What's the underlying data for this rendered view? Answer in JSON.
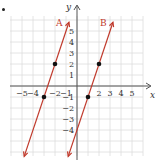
{
  "chart_data": {
    "type": "line",
    "title": "",
    "xlabel": "x",
    "ylabel": "y",
    "xlim": [
      -6,
      6
    ],
    "ylim": [
      -6,
      6
    ],
    "grid": true,
    "x_ticks": [
      -5,
      -4,
      -2,
      -1,
      2,
      3,
      4,
      5
    ],
    "y_ticks": [
      5,
      4,
      3,
      2,
      1,
      -1,
      -2,
      -3,
      -4
    ],
    "series": [
      {
        "name": "A",
        "slope": 3,
        "intercept": 8,
        "points": [
          [
            -2,
            2
          ],
          [
            -3,
            -1
          ]
        ],
        "color": "#c0392b"
      },
      {
        "name": "B",
        "slope": 3,
        "intercept": -4,
        "points": [
          [
            2,
            2
          ],
          [
            1,
            -1
          ]
        ],
        "color": "#c0392b"
      }
    ]
  },
  "labels": {
    "x_axis": "x",
    "y_axis": "y",
    "line_a": "A",
    "line_b": "B"
  },
  "colors": {
    "line": "#c0392b",
    "grid": "#dddddd",
    "axis": "#555555",
    "point": "#111111"
  }
}
